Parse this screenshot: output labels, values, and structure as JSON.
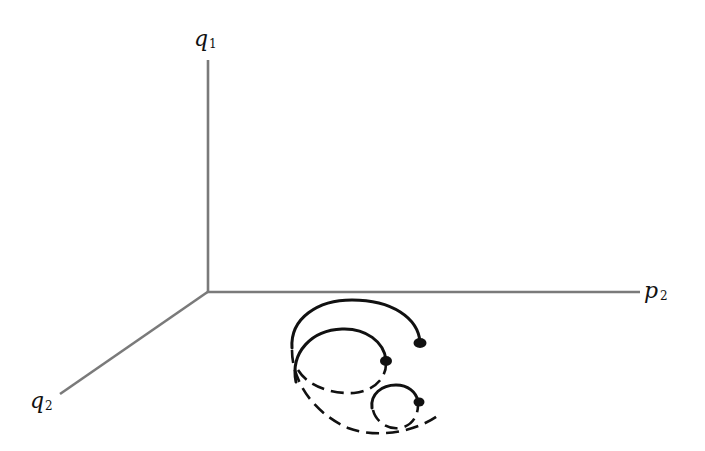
{
  "diagram": {
    "type": "3d-phase-space-axes",
    "axes": {
      "vertical": {
        "symbol": "q",
        "subscript": "1"
      },
      "horizontal": {
        "symbol": "p",
        "subscript": "2"
      },
      "depth": {
        "symbol": "q",
        "subscript": "2"
      }
    },
    "trajectories": [
      {
        "id": "large-orbit",
        "style": "solid arc above, dashed arc below",
        "endpoint": "filled-dot"
      },
      {
        "id": "medium-orbit",
        "style": "solid arc above, dashed arc below",
        "endpoint": "filled-dot"
      },
      {
        "id": "small-orbit",
        "style": "solid arc above, dashed arc below",
        "endpoint": "filled-dot"
      }
    ],
    "colors": {
      "axis": "#7a7a7a",
      "curve": "#111111",
      "background": "#ffffff"
    }
  }
}
